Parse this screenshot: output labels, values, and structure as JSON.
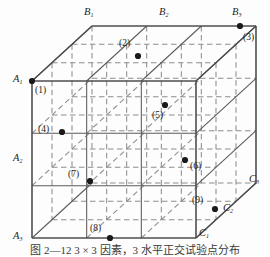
{
  "figure": {
    "caption": "图 2—12   3 × 3 因素，3 水平正交试验点分布",
    "shape": "cube-lattice",
    "line_color": "#595959",
    "dash_color": "#8a8a8a",
    "dot_color": "#1a1a1a",
    "background": "#fdfdfd"
  },
  "axis_labels": [
    {
      "name": "A1",
      "base": "A",
      "sub": "1",
      "x": 13,
      "y": 74
    },
    {
      "name": "A2",
      "base": "A",
      "sub": "2",
      "x": 13,
      "y": 153
    },
    {
      "name": "A3",
      "base": "A",
      "sub": "3",
      "x": 13,
      "y": 231
    },
    {
      "name": "B1",
      "base": "B",
      "sub": "1",
      "x": 84,
      "y": 7
    },
    {
      "name": "B2",
      "base": "B",
      "sub": "2",
      "x": 159,
      "y": 7
    },
    {
      "name": "B3",
      "base": "B",
      "sub": "3",
      "x": 232,
      "y": 7
    },
    {
      "name": "C1",
      "base": "C",
      "sub": "1",
      "x": 199,
      "y": 228
    },
    {
      "name": "C2",
      "base": "C",
      "sub": "2",
      "x": 223,
      "y": 203
    },
    {
      "name": "C3",
      "base": "C",
      "sub": "3",
      "x": 249,
      "y": 174
    }
  ],
  "points": [
    {
      "id": "1",
      "label": "(1)",
      "dot_x": 32,
      "dot_y": 81,
      "lbl_x": 35,
      "lbl_y": 86,
      "dot": true
    },
    {
      "id": "2",
      "label": "(2)",
      "dot_x": 138,
      "dot_y": 56,
      "lbl_x": 119,
      "lbl_y": 39,
      "dot": true
    },
    {
      "id": "3",
      "label": "(3)",
      "dot_x": 240,
      "dot_y": 26,
      "lbl_x": 243,
      "lbl_y": 33,
      "dot": true
    },
    {
      "id": "4",
      "label": "(4)",
      "dot_x": 62,
      "dot_y": 132,
      "lbl_x": 38,
      "lbl_y": 125,
      "dot": true
    },
    {
      "id": "5",
      "label": "(5)",
      "dot_x": 165,
      "dot_y": 105,
      "lbl_x": 152,
      "lbl_y": 111,
      "dot": true
    },
    {
      "id": "6",
      "label": "(6)",
      "dot_x": 185,
      "dot_y": 160,
      "lbl_x": 190,
      "lbl_y": 162,
      "dot": true
    },
    {
      "id": "7",
      "label": "(7)",
      "dot_x": 90,
      "dot_y": 181,
      "lbl_x": 68,
      "lbl_y": 170,
      "dot": true
    },
    {
      "id": "8",
      "label": "(8)",
      "dot_x": 110,
      "dot_y": 238,
      "lbl_x": 90,
      "lbl_y": 224,
      "dot": true
    },
    {
      "id": "9",
      "label": "(9)",
      "dot_x": 215,
      "dot_y": 209,
      "lbl_x": 192,
      "lbl_y": 196,
      "dot": true
    }
  ],
  "legend_note": {
    "levels_A": [
      "A1",
      "A2",
      "A3"
    ],
    "levels_B": [
      "B1",
      "B2",
      "B3"
    ],
    "levels_C": [
      "C1",
      "C2",
      "C3"
    ],
    "point_count": 9
  }
}
